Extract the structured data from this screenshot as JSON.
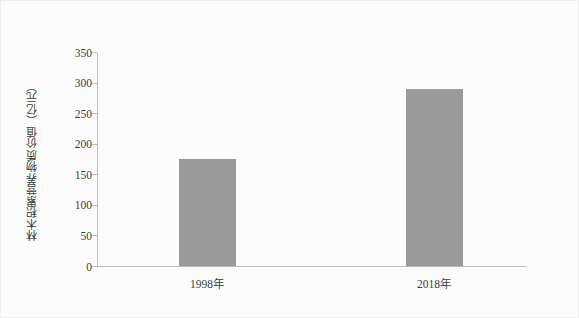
{
  "chart_data": {
    "type": "bar",
    "title": "",
    "xlabel": "",
    "ylabel": "林木积累营养物质价值（亿元）",
    "categories": [
      "1998年",
      "2018年"
    ],
    "values": [
      175,
      289
    ],
    "ylim": [
      0,
      350
    ],
    "yticks": [
      0,
      50,
      100,
      150,
      200,
      250,
      300,
      350
    ],
    "ytick_labels": [
      "0",
      "50",
      "100",
      "150",
      "200",
      "250",
      "300",
      "350"
    ],
    "grid": false,
    "legend": null,
    "series": [
      {
        "name": "林木积累营养物质价值",
        "values": [
          175,
          289
        ]
      }
    ],
    "colors": {
      "bar": "#9a9a9a",
      "axis": "#bdbdbd",
      "text": "#3c3c3c",
      "background": "#fcfcfc"
    }
  }
}
